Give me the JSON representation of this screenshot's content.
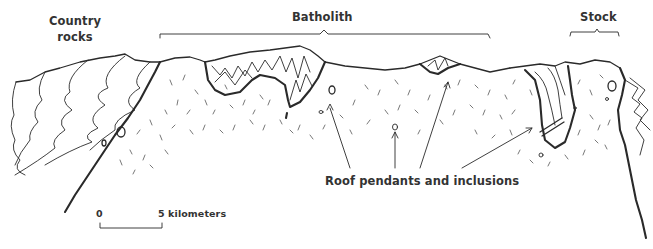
{
  "diagram": {
    "type": "geologic-cross-section",
    "labels": {
      "country_rocks_line1": "Country",
      "country_rocks_line2": "rocks",
      "batholith": "Batholith",
      "stock": "Stock",
      "roof_pendants": "Roof pendants and inclusions"
    },
    "scale_bar": {
      "start_label": "0",
      "end_label": "5 kilometers"
    },
    "colors": {
      "ink": "#2a2a2a",
      "background": "#ffffff"
    }
  }
}
